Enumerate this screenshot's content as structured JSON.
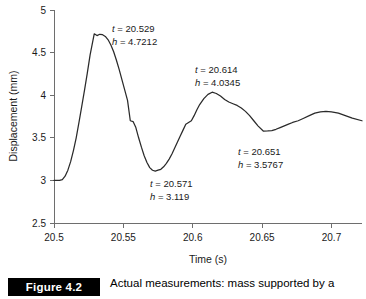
{
  "chart_data": {
    "type": "line",
    "title": "",
    "xlabel": "Time (s)",
    "ylabel": "Displacement (mm)",
    "xlim": [
      20.5,
      20.722
    ],
    "ylim": [
      2.5,
      5.0
    ],
    "grid": false,
    "legend": "none",
    "xticks": [
      "20.5",
      "20.55",
      "20.6",
      "20.65",
      "20.7"
    ],
    "xtick_values": [
      20.5,
      20.55,
      20.6,
      20.65,
      20.7
    ],
    "yticks": [
      "2.5",
      "3",
      "3.5",
      "4",
      "4.5",
      "5"
    ],
    "ytick_values": [
      2.5,
      3,
      3.5,
      4,
      4.5,
      5
    ],
    "series": [
      {
        "name": "displacement",
        "x": [
          20.5,
          20.502,
          20.504,
          20.506,
          20.508,
          20.51,
          20.512,
          20.514,
          20.516,
          20.518,
          20.52,
          20.522,
          20.524,
          20.526,
          20.529,
          20.531,
          20.533,
          20.535,
          20.537,
          20.539,
          20.541,
          20.543,
          20.545,
          20.547,
          20.549,
          20.551,
          20.553,
          20.555,
          20.557,
          20.559,
          20.561,
          20.563,
          20.565,
          20.567,
          20.569,
          20.571,
          20.573,
          20.575,
          20.577,
          20.579,
          20.581,
          20.583,
          20.585,
          20.587,
          20.589,
          20.591,
          20.593,
          20.595,
          20.597,
          20.599,
          20.601,
          20.603,
          20.605,
          20.608,
          20.611,
          20.614,
          20.617,
          20.62,
          20.623,
          20.626,
          20.629,
          20.632,
          20.635,
          20.638,
          20.641,
          20.644,
          20.647,
          20.651,
          20.654,
          20.657,
          20.66,
          20.663,
          20.666,
          20.669,
          20.672,
          20.676,
          20.68,
          20.684,
          20.688,
          20.692,
          20.696,
          20.7,
          20.705,
          20.71,
          20.715,
          20.722
        ],
        "y": [
          3.0,
          3.0,
          3.0,
          3.01,
          3.05,
          3.12,
          3.22,
          3.35,
          3.5,
          3.68,
          3.87,
          4.06,
          4.26,
          4.47,
          4.721,
          4.7,
          4.715,
          4.71,
          4.69,
          4.65,
          4.59,
          4.51,
          4.41,
          4.3,
          4.18,
          4.06,
          3.94,
          3.7,
          3.69,
          3.62,
          3.5,
          3.39,
          3.29,
          3.21,
          3.15,
          3.119,
          3.11,
          3.12,
          3.13,
          3.16,
          3.2,
          3.25,
          3.31,
          3.38,
          3.45,
          3.52,
          3.59,
          3.66,
          3.68,
          3.7,
          3.76,
          3.83,
          3.89,
          3.96,
          4.01,
          4.035,
          4.02,
          3.99,
          3.95,
          3.92,
          3.9,
          3.88,
          3.85,
          3.81,
          3.76,
          3.7,
          3.64,
          3.577,
          3.58,
          3.585,
          3.6,
          3.62,
          3.64,
          3.66,
          3.68,
          3.7,
          3.73,
          3.76,
          3.79,
          3.805,
          3.81,
          3.805,
          3.79,
          3.76,
          3.73,
          3.7
        ]
      }
    ],
    "annotations": [
      {
        "id": "peak-1",
        "t_label": "t = 20.529",
        "h_label": "h = 4.7212",
        "t": 20.529,
        "h": 4.7212,
        "left_px": 112,
        "top_px": 22
      },
      {
        "id": "trough-1",
        "t_label": "t = 20.571",
        "h_label": "h = 3.119",
        "t": 20.571,
        "h": 3.119,
        "left_px": 150,
        "top_px": 177
      },
      {
        "id": "peak-2",
        "t_label": "t = 20.614",
        "h_label": "h = 4.0345",
        "t": 20.614,
        "h": 4.0345,
        "left_px": 195,
        "top_px": 63
      },
      {
        "id": "trough-2",
        "t_label": "t = 20.651",
        "h_label": "h = 3.5767",
        "t": 20.651,
        "h": 3.5767,
        "left_px": 238,
        "top_px": 145
      }
    ]
  },
  "caption": {
    "figure_tag": "Figure 4.2",
    "text": "Actual measurements: mass supported by a"
  },
  "colors": {
    "curve": "#2a2a2a",
    "axis": "#6e6e6e",
    "text": "#1a1a1a",
    "tag_background": "#000000",
    "tag_text": "#ffffff",
    "background": "#ffffff"
  }
}
